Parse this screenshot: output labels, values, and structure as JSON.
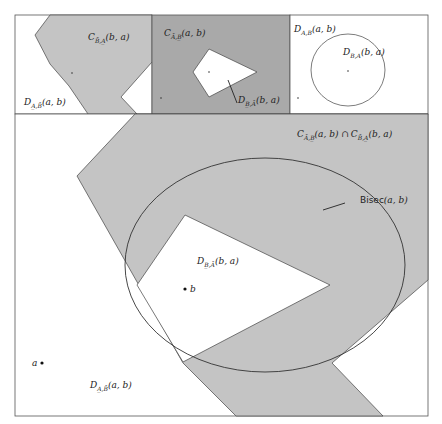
{
  "colors": {
    "shade_light": "#c4c4c4",
    "shade_dark": "#a9a9a9",
    "stroke": "#444444",
    "background": "#ffffff"
  },
  "panels": {
    "top_left": {
      "label_main": "C",
      "label_sub": "B̄,A̲",
      "label_args": "(b, a)",
      "label2_main": "D",
      "label2_sub": "A̲,B̄",
      "label2_args": "(a, b)"
    },
    "top_middle": {
      "label_main": "C",
      "label_sub": "Ā,B̲",
      "label_args": "(a, b)",
      "label2_main": "D",
      "label2_sub": "B̲,Ā",
      "label2_args": "(b, a)"
    },
    "top_right": {
      "label_main": "D",
      "label_sub": "A,B",
      "label_args": "(a, b)",
      "label2_main": "D",
      "label2_sub": "B,A",
      "label2_args": "(b, a)"
    },
    "main": {
      "intersection_label_1_main": "C",
      "intersection_label_1_sub": "Ā,B̲",
      "intersection_label_1_args": "(a, b) ∩",
      "intersection_label_2_main": "C",
      "intersection_label_2_sub": "B̄,A̲",
      "intersection_label_2_args": "(b, a)",
      "bisector_label": "Bisec",
      "bisector_args": "(a, b)",
      "inner_label_main": "D",
      "inner_label_sub": "B̲,Ā",
      "inner_label_args": "(b, a)",
      "outer_label_main": "D",
      "outer_label_sub": "A̲,B̄",
      "outer_label_args": "(a, b)",
      "point_a": "a",
      "point_b": "b"
    }
  }
}
